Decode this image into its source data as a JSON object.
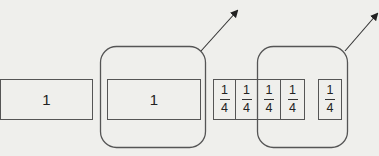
{
  "diagram": {
    "whole_box": {
      "label": "1"
    },
    "grouped_whole_box": {
      "label": "1"
    },
    "fraction_strip": {
      "cells": [
        {
          "numerator": "1",
          "denominator": "4"
        },
        {
          "numerator": "1",
          "denominator": "4"
        },
        {
          "numerator": "1",
          "denominator": "4"
        },
        {
          "numerator": "1",
          "denominator": "4"
        }
      ]
    },
    "single_fraction": {
      "numerator": "1",
      "denominator": "4"
    },
    "groups": [
      {
        "name": "group-whole",
        "has_arrow": true
      },
      {
        "name": "group-fractions",
        "has_arrow": true
      }
    ],
    "colors": {
      "background": "#efefec",
      "stroke": "#555555",
      "text": "#222222"
    }
  }
}
